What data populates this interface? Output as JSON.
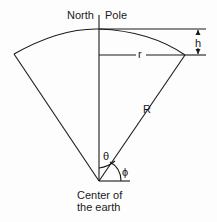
{
  "labels": {
    "north": "North",
    "pole": "Pole",
    "h": "h",
    "r": "r",
    "R": "R",
    "theta": "θ",
    "phi": "ϕ",
    "center_line1": "Center of",
    "center_line2": "the earth"
  }
}
